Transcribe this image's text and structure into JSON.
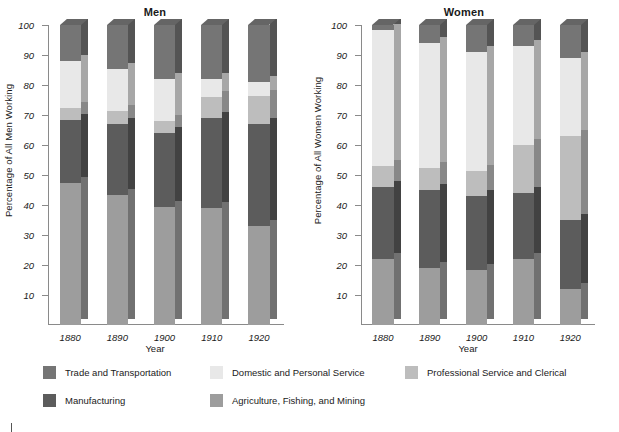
{
  "chart_data": {
    "type": "bar",
    "subtype": "100% stacked bar, two panels",
    "grid": false,
    "legend_position": "bottom",
    "ylim": [
      0,
      100
    ],
    "yticks": [
      100,
      90,
      80,
      70,
      60,
      50,
      40,
      30,
      20,
      10
    ],
    "categories": [
      "1880",
      "1890",
      "1900",
      "1910",
      "1920"
    ],
    "xlabel": "Year",
    "series_order_bottom_to_top": [
      "Agriculture, Fishing, and Mining",
      "Manufacturing",
      "Professional Service and Clerical",
      "Domestic and Personal Service",
      "Trade and Transportation"
    ],
    "colors": {
      "Trade and Transportation": "#757575",
      "Domestic and Personal Service": "#e8e8e8",
      "Professional Service and Clerical": "#bdbdbd",
      "Manufacturing": "#5c5c5c",
      "Agriculture, Fishing, and Mining": "#9d9d9d"
    },
    "panels": [
      {
        "title": "Men",
        "ylabel": "Percentage of All Men Working",
        "series": [
          {
            "name": "Agriculture, Fishing, and Mining",
            "values": [
              47.5,
              43.5,
              39.5,
              39.0,
              33.0
            ]
          },
          {
            "name": "Manufacturing",
            "values": [
              21.0,
              23.5,
              24.5,
              30.0,
              34.0
            ]
          },
          {
            "name": "Professional Service and Clerical",
            "values": [
              4.0,
              4.5,
              4.0,
              7.0,
              9.5
            ]
          },
          {
            "name": "Domestic and Personal Service",
            "values": [
              15.5,
              14.0,
              14.0,
              6.0,
              4.5
            ]
          },
          {
            "name": "Trade and Transportation",
            "values": [
              12.0,
              14.5,
              18.0,
              18.0,
              19.0
            ]
          }
        ]
      },
      {
        "title": "Women",
        "ylabel": "Percentage of All Women Working",
        "series": [
          {
            "name": "Agriculture, Fishing, and Mining",
            "values": [
              22.0,
              19.0,
              18.5,
              22.0,
              12.0
            ]
          },
          {
            "name": "Manufacturing",
            "values": [
              24.0,
              26.0,
              24.5,
              22.0,
              23.0
            ]
          },
          {
            "name": "Professional Service and Clerical",
            "values": [
              7.0,
              7.5,
              8.5,
              16.0,
              28.0
            ]
          },
          {
            "name": "Domestic and Personal Service",
            "values": [
              45.5,
              41.5,
              39.5,
              33.0,
              26.0
            ]
          },
          {
            "name": "Trade and Transportation",
            "values": [
              1.5,
              6.0,
              9.0,
              7.0,
              11.0
            ]
          }
        ]
      }
    ],
    "legend": [
      {
        "label": "Trade and Transportation",
        "color": "#757575"
      },
      {
        "label": "Domestic and Personal Service",
        "color": "#e8e8e8"
      },
      {
        "label": "Professional Service and Clerical",
        "color": "#bdbdbd"
      },
      {
        "label": "Manufacturing",
        "color": "#5c5c5c"
      },
      {
        "label": "Agriculture, Fishing, and Mining",
        "color": "#9d9d9d"
      }
    ]
  }
}
